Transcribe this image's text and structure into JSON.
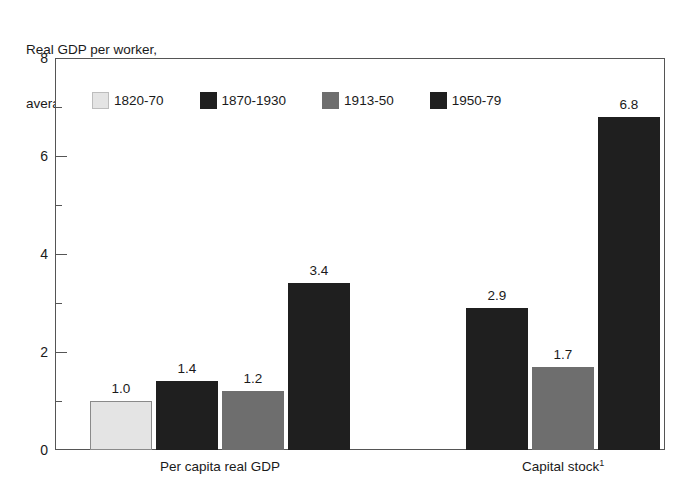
{
  "chart_data": {
    "type": "bar",
    "title": "Real GDP per worker, average annual growth rate (percentage)",
    "title_line1": "Real GDP per worker,",
    "title_line2": "average annual growth rate (percentage)",
    "xlabel": "",
    "ylabel": "",
    "ylim": [
      0,
      8
    ],
    "ytick_labels": [
      "0",
      "2",
      "4",
      "6",
      "8"
    ],
    "ytick_values": [
      0,
      2,
      4,
      6,
      8
    ],
    "yminor_values": [
      1,
      3,
      5,
      7
    ],
    "grid": false,
    "legend_position": "inside-top-left",
    "categories": [
      "Per capita real GDP",
      "Capital stock¹"
    ],
    "category_labels": [
      {
        "text": "Per capita real GDP",
        "footnote": ""
      },
      {
        "text": "Capital stock",
        "footnote": "1"
      }
    ],
    "series": [
      {
        "name": "1820-70",
        "color": "#e4e4e4",
        "outlined": true,
        "values": [
          1.0,
          null
        ],
        "value_labels": [
          "1.0",
          ""
        ]
      },
      {
        "name": "1870-1930",
        "color": "#1f1f1f",
        "outlined": false,
        "values": [
          1.4,
          2.9
        ],
        "value_labels": [
          "1.4",
          "2.9"
        ]
      },
      {
        "name": "1913-50",
        "color": "#6e6e6e",
        "outlined": false,
        "values": [
          1.2,
          1.7
        ],
        "value_labels": [
          "1.2",
          "1.7"
        ]
      },
      {
        "name": "1950-79",
        "color": "#1f1f1f",
        "outlined": false,
        "values": [
          3.4,
          6.8
        ],
        "value_labels": [
          "3.4",
          "6.8"
        ]
      }
    ]
  },
  "legend": {
    "items": [
      {
        "label": "1820-70",
        "color": "#e4e4e4",
        "outlined": true
      },
      {
        "label": "1870-1930",
        "color": "#1f1f1f",
        "outlined": false
      },
      {
        "label": "1913-50",
        "color": "#6e6e6e",
        "outlined": false
      },
      {
        "label": "1950-79",
        "color": "#1f1f1f",
        "outlined": false
      }
    ]
  }
}
